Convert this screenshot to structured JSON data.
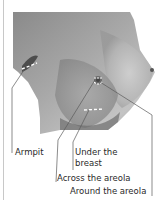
{
  "figure": {
    "accent_color": "#ffffff",
    "line_color": "#5a5a5a",
    "labels": [
      {
        "id": "armpit",
        "text": "Armpit"
      },
      {
        "id": "under-breast-line1",
        "text": "Under the"
      },
      {
        "id": "under-breast-line2",
        "text": "breast"
      },
      {
        "id": "across-areola",
        "text": "Across the areola"
      },
      {
        "id": "around-areola",
        "text": "Around the areola"
      }
    ]
  }
}
